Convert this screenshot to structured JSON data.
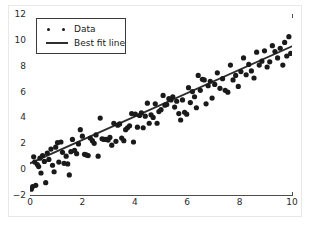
{
  "figure": {
    "background_color": "#ffffff",
    "frame_color": "#e8e8e8",
    "axes_color": "#4d4d4d",
    "title": "",
    "marker_color": "#1a1a1a",
    "line_color": "#2e2e2e"
  },
  "legend": {
    "position": "upper-left",
    "entries": [
      {
        "label": "Data",
        "marker": "scatter-dots-icon"
      },
      {
        "label": "Best fit line",
        "marker": "solid-line-icon"
      }
    ]
  },
  "axes": {
    "x": {
      "label": "",
      "min": 0,
      "max": 10,
      "ticks": [
        0,
        2,
        4,
        6,
        8,
        10
      ],
      "ticklabels": [
        "0",
        "2",
        "4",
        "6",
        "8",
        "10"
      ]
    },
    "y": {
      "label": "",
      "min": -2,
      "max": 12,
      "ticks": [
        -2,
        0,
        2,
        4,
        6,
        8,
        10,
        12
      ],
      "ticklabels": [
        "−2",
        "0",
        "2",
        "4",
        "6",
        "8",
        "10",
        "12"
      ]
    }
  },
  "chart_data": {
    "type": "scatter",
    "title": "",
    "xlabel": "",
    "ylabel": "",
    "xlim": [
      0,
      10
    ],
    "ylim": [
      -2,
      12
    ],
    "grid": false,
    "legend_position": "upper left",
    "series": [
      {
        "name": "Data",
        "type": "scatter",
        "marker": "o",
        "marker_size": 4,
        "color": "#1a1a1a",
        "points": [
          [
            0.05,
            -1.55
          ],
          [
            0.1,
            -1.35
          ],
          [
            0.14,
            0.95
          ],
          [
            0.18,
            0.55
          ],
          [
            0.22,
            -1.25
          ],
          [
            0.28,
            0.35
          ],
          [
            0.33,
            0.2
          ],
          [
            0.38,
            0.85
          ],
          [
            0.42,
            -0.3
          ],
          [
            0.48,
            1.05
          ],
          [
            0.55,
            0.6
          ],
          [
            0.6,
            -1.05
          ],
          [
            0.66,
            1.25
          ],
          [
            0.72,
            0.75
          ],
          [
            0.8,
            1.55
          ],
          [
            0.86,
            0.3
          ],
          [
            0.92,
            -0.2
          ],
          [
            0.98,
            1.7
          ],
          [
            1.05,
            2.05
          ],
          [
            1.1,
            0.55
          ],
          [
            1.18,
            2.1
          ],
          [
            1.24,
            1.3
          ],
          [
            1.3,
            0.45
          ],
          [
            1.38,
            1.0
          ],
          [
            1.44,
            0.4
          ],
          [
            1.5,
            -0.45
          ],
          [
            1.56,
            1.35
          ],
          [
            1.62,
            2.3
          ],
          [
            1.7,
            1.45
          ],
          [
            1.78,
            1.2
          ],
          [
            1.85,
            1.95
          ],
          [
            1.92,
            3.05
          ],
          [
            2.0,
            2.55
          ],
          [
            2.08,
            1.15
          ],
          [
            2.15,
            1.1
          ],
          [
            2.22,
            1.05
          ],
          [
            2.3,
            2.4
          ],
          [
            2.38,
            2.2
          ],
          [
            2.45,
            2.0
          ],
          [
            2.52,
            2.65
          ],
          [
            2.6,
            1.0
          ],
          [
            2.68,
            3.95
          ],
          [
            2.75,
            2.35
          ],
          [
            2.82,
            2.3
          ],
          [
            2.9,
            2.3
          ],
          [
            2.98,
            2.25
          ],
          [
            3.05,
            2.45
          ],
          [
            3.12,
            1.85
          ],
          [
            3.2,
            3.55
          ],
          [
            3.28,
            2.15
          ],
          [
            3.35,
            3.4
          ],
          [
            3.42,
            3.5
          ],
          [
            3.5,
            2.4
          ],
          [
            3.58,
            2.2
          ],
          [
            3.65,
            3.05
          ],
          [
            3.72,
            3.2
          ],
          [
            3.8,
            3.35
          ],
          [
            3.88,
            4.3
          ],
          [
            3.95,
            2.1
          ],
          [
            4.02,
            4.25
          ],
          [
            4.1,
            3.25
          ],
          [
            4.18,
            4.15
          ],
          [
            4.25,
            4.35
          ],
          [
            4.32,
            3.2
          ],
          [
            4.4,
            4.1
          ],
          [
            4.48,
            5.1
          ],
          [
            4.55,
            3.55
          ],
          [
            4.62,
            4.2
          ],
          [
            4.7,
            4.0
          ],
          [
            4.78,
            5.05
          ],
          [
            4.85,
            3.55
          ],
          [
            4.92,
            4.45
          ],
          [
            5.0,
            4.6
          ],
          [
            5.08,
            5.7
          ],
          [
            5.15,
            4.95
          ],
          [
            5.22,
            5.0
          ],
          [
            5.3,
            5.45
          ],
          [
            5.38,
            5.35
          ],
          [
            5.45,
            5.6
          ],
          [
            5.52,
            4.8
          ],
          [
            5.6,
            5.25
          ],
          [
            5.68,
            4.3
          ],
          [
            5.75,
            3.8
          ],
          [
            5.82,
            5.35
          ],
          [
            5.9,
            4.4
          ],
          [
            5.98,
            4.25
          ],
          [
            6.05,
            6.3
          ],
          [
            6.12,
            5.15
          ],
          [
            6.2,
            6.0
          ],
          [
            6.28,
            5.6
          ],
          [
            6.35,
            4.75
          ],
          [
            6.42,
            7.25
          ],
          [
            6.5,
            6.1
          ],
          [
            6.58,
            6.95
          ],
          [
            6.65,
            6.9
          ],
          [
            6.72,
            5.05
          ],
          [
            6.8,
            6.45
          ],
          [
            6.88,
            6.8
          ],
          [
            6.95,
            5.5
          ],
          [
            7.05,
            6.55
          ],
          [
            7.15,
            7.45
          ],
          [
            7.25,
            6.25
          ],
          [
            7.35,
            7.0
          ],
          [
            7.45,
            6.1
          ],
          [
            7.55,
            5.95
          ],
          [
            7.65,
            8.05
          ],
          [
            7.75,
            6.9
          ],
          [
            7.85,
            7.25
          ],
          [
            7.95,
            6.4
          ],
          [
            8.05,
            7.55
          ],
          [
            8.15,
            8.6
          ],
          [
            8.25,
            7.3
          ],
          [
            8.35,
            8.1
          ],
          [
            8.45,
            7.6
          ],
          [
            8.55,
            7.05
          ],
          [
            8.65,
            9.05
          ],
          [
            8.75,
            8.05
          ],
          [
            8.85,
            8.35
          ],
          [
            8.95,
            9.15
          ],
          [
            9.05,
            7.9
          ],
          [
            9.15,
            8.3
          ],
          [
            9.25,
            9.55
          ],
          [
            9.35,
            9.1
          ],
          [
            9.45,
            8.6
          ],
          [
            9.55,
            9.35
          ],
          [
            9.65,
            8.05
          ],
          [
            9.72,
            9.8
          ],
          [
            9.8,
            8.75
          ],
          [
            9.88,
            10.25
          ],
          [
            9.95,
            8.95
          ]
        ]
      },
      {
        "name": "Best fit line",
        "type": "line",
        "color": "#2e2e2e",
        "linewidth": 1.8,
        "slope": 0.905,
        "intercept": 0.45,
        "endpoints": [
          [
            0,
            0.45
          ],
          [
            10,
            9.5
          ]
        ]
      }
    ]
  }
}
